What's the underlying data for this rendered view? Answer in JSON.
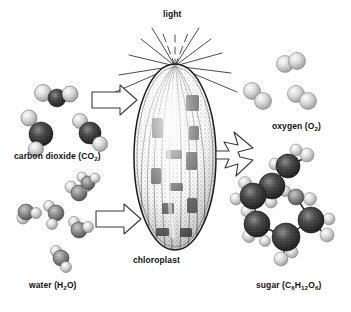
{
  "figure": {
    "background_color": "#ffffff",
    "ink_color": "#121212",
    "width": 351,
    "height": 312
  },
  "labels": {
    "light": "light",
    "carbon_dioxide": "carbon dioxide (CO",
    "carbon_dioxide_sub": "2",
    "carbon_dioxide_end": ")",
    "water": "water (H",
    "water_sub": "2",
    "water_end": "O)",
    "chloroplast": "chloroplast",
    "oxygen": "oxygen (O",
    "oxygen_sub": "2",
    "oxygen_end": ")",
    "sugar": "sugar (C",
    "sugar_sub1": "6",
    "sugar_mid1": "H",
    "sugar_sub2": "12",
    "sugar_mid2": "O",
    "sugar_sub3": "6",
    "sugar_end": ")"
  },
  "elements": {
    "light_rays": "light-rays",
    "chloroplast_body": "chloroplast-organelle",
    "input_arrow_co2": "arrow-co2-into-chloroplast",
    "input_arrow_water": "arrow-water-into-chloroplast",
    "output_arrow_forked": "forked-arrow-products",
    "co2_molecules": "carbon-dioxide-molecules",
    "water_molecules": "water-molecules",
    "oxygen_molecules": "oxygen-molecules",
    "sugar_molecule": "glucose-molecule"
  },
  "diagram_data": {
    "type": "process-diagram",
    "process": "photosynthesis",
    "inputs": [
      "carbon dioxide (CO2)",
      "water (H2O)",
      "light"
    ],
    "site": "chloroplast",
    "outputs": [
      "oxygen (O2)",
      "sugar (C6H12O6)"
    ],
    "molecule_counts": {
      "carbon_dioxide": 3,
      "water": 6,
      "oxygen": 3,
      "sugar": 1
    },
    "light_ray_count": 13
  }
}
